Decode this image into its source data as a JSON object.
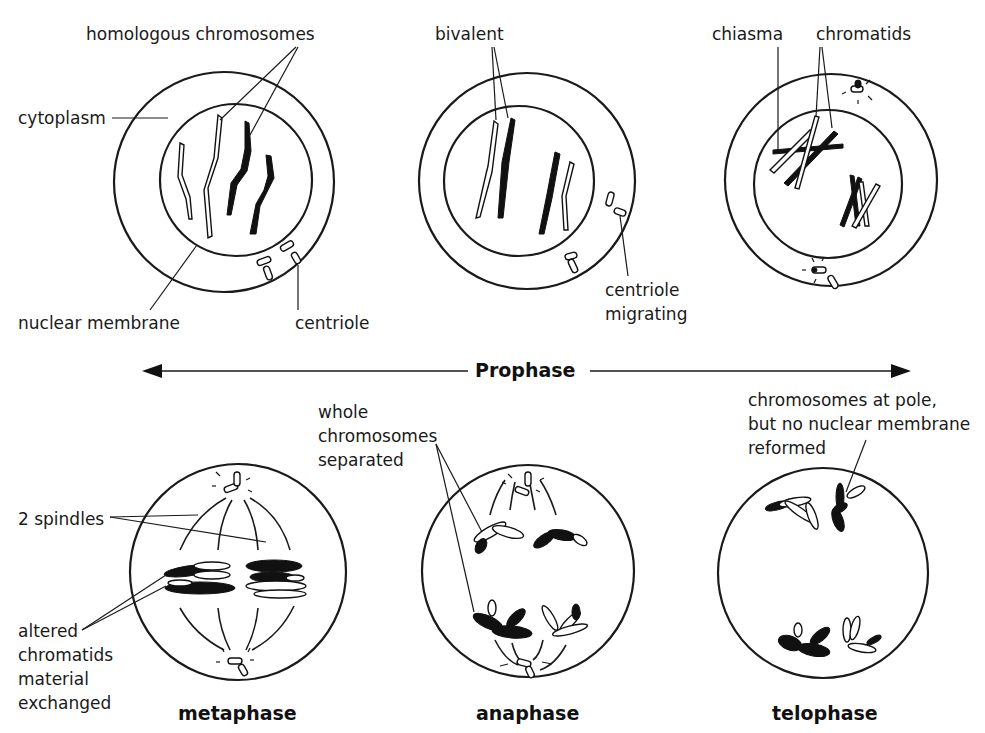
{
  "diagram": {
    "prophase_label": "Prophase",
    "prophase_stages": [
      {
        "id": "early-prophase",
        "labels": {
          "homologous_chromosomes": "homologous chromosomes",
          "cytoplasm": "cytoplasm",
          "nuclear_membrane": "nuclear membrane",
          "centriole": "centriole"
        }
      },
      {
        "id": "mid-prophase",
        "labels": {
          "bivalent": "bivalent",
          "centriole_migrating_1": "centriole",
          "centriole_migrating_2": "migrating"
        }
      },
      {
        "id": "late-prophase",
        "labels": {
          "chiasma": "chiasma",
          "chromatids": "chromatids"
        }
      }
    ],
    "division_stages": [
      {
        "id": "metaphase",
        "title": "metaphase",
        "labels": {
          "spindles": "2 spindles",
          "altered_1": "altered",
          "altered_2": "chromatids",
          "altered_3": "material",
          "altered_4": "exchanged"
        }
      },
      {
        "id": "anaphase",
        "title": "anaphase",
        "labels": {
          "whole_1": "whole",
          "whole_2": "chromosomes",
          "whole_3": "separated"
        }
      },
      {
        "id": "telophase",
        "title": "telophase",
        "labels": {
          "pole_1": "chromosomes at pole,",
          "pole_2": "but no nuclear membrane",
          "pole_3": "reformed"
        }
      }
    ]
  }
}
